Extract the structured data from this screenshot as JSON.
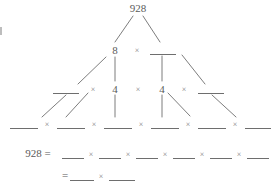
{
  "worksheet": {
    "type": "factor-tree",
    "target_number": "928",
    "multiply_symbol": "×",
    "equals_symbol": "=",
    "ink_color": "#5a5a5a",
    "blank_color": "#6e6e6e",
    "background_color": "#ffffff",
    "rows": [
      {
        "level": 1,
        "name": "root",
        "items": [
          {
            "kind": "number",
            "text": "928"
          }
        ]
      },
      {
        "level": 2,
        "name": "second-level",
        "items": [
          {
            "kind": "number",
            "text": "8"
          },
          {
            "kind": "operator",
            "text": "×"
          },
          {
            "kind": "blank",
            "text": ""
          }
        ]
      },
      {
        "level": 3,
        "name": "third-level",
        "items": [
          {
            "kind": "blank",
            "text": ""
          },
          {
            "kind": "operator",
            "text": "×"
          },
          {
            "kind": "number",
            "text": "4"
          },
          {
            "kind": "operator",
            "text": "×"
          },
          {
            "kind": "number",
            "text": "4"
          },
          {
            "kind": "operator",
            "text": "×"
          },
          {
            "kind": "blank",
            "text": ""
          }
        ]
      },
      {
        "level": 4,
        "name": "fourth-level",
        "items": [
          {
            "kind": "blank",
            "text": ""
          },
          {
            "kind": "operator",
            "text": "×"
          },
          {
            "kind": "blank",
            "text": ""
          },
          {
            "kind": "operator",
            "text": "×"
          },
          {
            "kind": "blank",
            "text": ""
          },
          {
            "kind": "operator",
            "text": "×"
          },
          {
            "kind": "blank",
            "text": ""
          },
          {
            "kind": "operator",
            "text": "×"
          },
          {
            "kind": "blank",
            "text": ""
          },
          {
            "kind": "operator",
            "text": "×"
          },
          {
            "kind": "blank",
            "text": ""
          }
        ]
      }
    ],
    "answer_lines": [
      {
        "name": "expanded-factorization",
        "lead": "928 =",
        "blanks": 6,
        "operators": [
          "×",
          "×",
          "×",
          "×",
          "×"
        ]
      },
      {
        "name": "prime-factorization",
        "lead": "=",
        "blanks": 2,
        "operators": [
          "×"
        ]
      }
    ],
    "labels": {
      "root": "928",
      "level2_num": "8",
      "level2_op": "×",
      "level3_op1": "×",
      "level3_num1": "4",
      "level3_op2": "×",
      "level3_num2": "4",
      "level3_op3": "×",
      "level4_op1": "×",
      "level4_op2": "×",
      "level4_op3": "×",
      "level4_op4": "×",
      "level4_op5": "×",
      "ans1_lead": "928 =",
      "ans1_op1": "×",
      "ans1_op2": "×",
      "ans1_op3": "×",
      "ans1_op4": "×",
      "ans1_op5": "×",
      "ans2_lead": "=",
      "ans2_op1": "×"
    }
  }
}
